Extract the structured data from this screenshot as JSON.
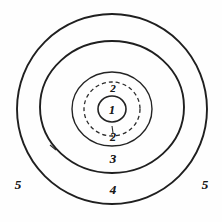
{
  "diagram": {
    "background_color": "#fefefe",
    "stroke_color": "#1f1f1f",
    "label_color": "#1a1a1a",
    "center": {
      "x": 112,
      "y": 109
    },
    "rings": [
      {
        "id": "ring-1",
        "zone_label": "1",
        "style": "solid",
        "rx": 14,
        "ry": 13,
        "stroke_width": 1.5
      },
      {
        "id": "ring-2",
        "zone_label": "2",
        "style": "dashed",
        "rx": 28,
        "ry": 27,
        "stroke_width": 1.3,
        "dash_pattern": "4 3"
      },
      {
        "id": "ring-3",
        "zone_label": "3",
        "style": "solid",
        "rx": 40,
        "ry": 37,
        "stroke_width": 1.4
      },
      {
        "id": "ring-4",
        "zone_label": "4",
        "style": "solid",
        "rx": 72,
        "ry": 66,
        "stroke_width": 1.9
      },
      {
        "id": "ring-5",
        "zone_label": "5",
        "style": "solid",
        "rx": 95,
        "ry": 95,
        "stroke_width": 1.9
      }
    ],
    "labels": [
      {
        "name": "zone-label-1",
        "text": "1",
        "x": 112,
        "y": 110,
        "class": "lbl-1"
      },
      {
        "name": "zone-label-2-top",
        "text": "2",
        "x": 113,
        "y": 88,
        "class": "lbl-2top"
      },
      {
        "name": "zone-label-2-bottom",
        "text": "2",
        "x": 113,
        "y": 137,
        "class": "lbl-2bot"
      },
      {
        "name": "zone-label-3",
        "text": "3",
        "x": 113,
        "y": 158,
        "class": "lbl-3"
      },
      {
        "name": "zone-label-4",
        "text": "4",
        "x": 113,
        "y": 189,
        "class": "lbl-4"
      },
      {
        "name": "zone-label-5-left",
        "text": "5",
        "x": 18,
        "y": 184,
        "class": "lbl-5"
      },
      {
        "name": "zone-label-5-right",
        "text": "5",
        "x": 205,
        "y": 184,
        "class": "lbl-5"
      }
    ],
    "tick_marks": [
      {
        "name": "tick-ring-4-lower-left",
        "text": "\\",
        "x": 52,
        "y": 148
      },
      {
        "name": "tick-ring-2-bottom",
        "text": "1",
        "x": 112,
        "y": 128
      }
    ]
  }
}
